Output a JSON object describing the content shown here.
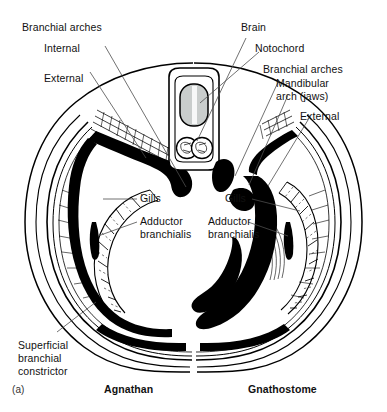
{
  "figure": {
    "panel_id": "(a)",
    "caption_left": "Agnathan",
    "caption_right": "Gnathostome"
  },
  "labels": {
    "left": {
      "branchial_arches": "Branchial arches",
      "internal": "Internal",
      "external": "External",
      "gills": "Gills",
      "adductor_line1": "Adductor",
      "adductor_line2": "branchialis",
      "superficial_line1": "Superficial",
      "superficial_line2": "branchial",
      "superficial_line3": "constrictor"
    },
    "center": {
      "brain": "Brain",
      "notochord": "Notochord"
    },
    "right": {
      "branchial_arches": "Branchial arches",
      "mandibular_line1": "Mandibular",
      "mandibular_line2": "arch (jaws)",
      "external": "External",
      "gills": "Gills",
      "adductor_line1": "Adductor",
      "adductor_line2": "branchialis"
    }
  },
  "colors": {
    "ink": "#000000",
    "notochord_fill": "#c9cdcc",
    "leader": "#4d4d4d",
    "background": "#ffffff"
  }
}
